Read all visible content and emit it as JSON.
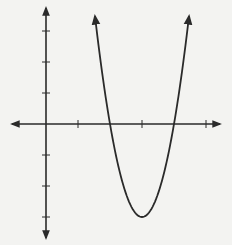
{
  "chart_data": {
    "type": "line",
    "title": "",
    "xlabel": "",
    "ylabel": "",
    "function": "y = 3(x - 2)(x - 4)",
    "vertex": [
      3,
      -3
    ],
    "roots": [
      2,
      4
    ],
    "x_ticks": [
      1,
      3,
      5
    ],
    "y_ticks": [
      -3,
      -2,
      -1,
      1,
      2,
      3
    ],
    "xlim": [
      -1,
      5.3
    ],
    "ylim": [
      -3.5,
      3.6
    ],
    "grid": false,
    "legend": null,
    "series": [
      {
        "name": "parabola",
        "x": [
          1.53,
          2,
          2.5,
          3,
          3.5,
          4,
          4.47
        ],
        "values": [
          3.48,
          0,
          -2.25,
          -3,
          -2.25,
          0,
          3.48
        ]
      }
    ]
  },
  "style": {
    "background": "#f3f3f1",
    "stroke": "#2a2a2a"
  },
  "layout": {
    "origin_px": [
      46,
      124
    ],
    "x_unit_px": 32,
    "y_unit_px": 31
  }
}
